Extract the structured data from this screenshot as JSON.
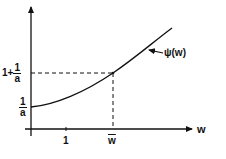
{
  "diagram": {
    "x_axis_label": "w",
    "curve_label": "ψ(w)",
    "x_ticks": [
      {
        "label": "1"
      },
      {
        "label": "w",
        "overbar": true
      }
    ],
    "y_ticks": [
      {
        "prefix": "",
        "numerator": "1",
        "denominator": "a"
      },
      {
        "prefix": "1+",
        "numerator": "1",
        "denominator": "a"
      }
    ],
    "colors": {
      "line": "#111111",
      "background": "#ffffff"
    }
  }
}
